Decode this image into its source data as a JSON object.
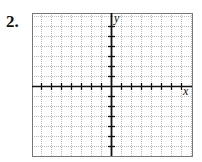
{
  "problem": {
    "number": "2."
  },
  "graph": {
    "x_label": "x",
    "y_label": "y",
    "grid": {
      "left": 32,
      "top": 13,
      "right": 192,
      "bottom": 156,
      "cell": 10
    },
    "origin": {
      "x": 111,
      "y": 86
    },
    "x_ticks_each_side": 7,
    "y_ticks_above": 6,
    "y_ticks_below": 6,
    "colors": {
      "grid": "#bbbbbb",
      "axis": "#111111",
      "border": "#777777"
    }
  }
}
